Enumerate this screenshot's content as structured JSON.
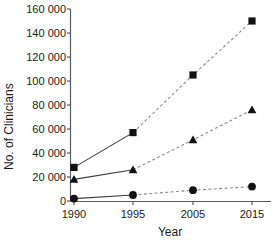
{
  "chart_data": {
    "type": "line",
    "title": "",
    "xlabel": "Year",
    "ylabel": "No. of Clinicians",
    "categories": [
      "1990",
      "1995",
      "2005",
      "2015"
    ],
    "x_tick_labels": [
      "1990",
      "1995",
      "2005",
      "2015"
    ],
    "y_tick_labels": [
      "0",
      "20 000",
      "40 000",
      "60 000",
      "80 000",
      "100 000",
      "120 000",
      "140 000",
      "160 000"
    ],
    "y_ticks": [
      0,
      20000,
      40000,
      60000,
      80000,
      100000,
      120000,
      140000,
      160000
    ],
    "ylim": [
      0,
      160000
    ],
    "grid": false,
    "legend": "none",
    "line_style_note": "1990-1995 segment solid (observed), 1995 onward dashed (projected)",
    "series": [
      {
        "name": "series-square",
        "marker": "square",
        "values": [
          28000,
          57000,
          105000,
          150000
        ]
      },
      {
        "name": "series-triangle",
        "marker": "triangle",
        "values": [
          18000,
          26000,
          51000,
          76000
        ]
      },
      {
        "name": "series-circle",
        "marker": "circle",
        "values": [
          2000,
          5000,
          9000,
          12000
        ]
      }
    ]
  },
  "colors": {
    "marker": "#111111",
    "solid_line": "#3c3c3c",
    "dashed_line": "#8a8a8a",
    "axis": "#5a5a5a",
    "text": "#1a1a1a",
    "background": "#ffffff"
  },
  "axis": {
    "y_title": "No. of Clinicians",
    "x_title": "Year"
  },
  "y_tick_labels": {
    "t0": "0",
    "t1": "20 000",
    "t2": "40 000",
    "t3": "60 000",
    "t4": "80 000",
    "t5": "100 000",
    "t6": "120 000",
    "t7": "140 000",
    "t8": "160 000"
  },
  "x_tick_labels": {
    "t0": "1990",
    "t1": "1995",
    "t2": "2005",
    "t3": "2015"
  }
}
